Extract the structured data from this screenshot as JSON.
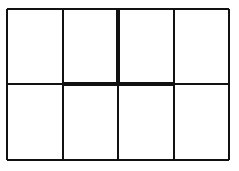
{
  "figure": {
    "title": "",
    "background_color": "#ffffff",
    "line_color": "#111111",
    "width": 239,
    "height": 171
  },
  "chart_data": {
    "type": "table",
    "title": "",
    "subtitle": "",
    "xlabel": "",
    "ylabel": "",
    "columns": 4,
    "rows": 2,
    "grid": true,
    "legend": "none",
    "bounds": {
      "left": 7,
      "right": 229,
      "top": 9,
      "bottom": 160
    },
    "column_dividers_x": [
      63,
      118,
      174
    ],
    "row_dividers_y": [
      84
    ],
    "column_edges_x": [
      7,
      63,
      118,
      174,
      229
    ],
    "row_edges_y": [
      9,
      84,
      160
    ],
    "cells": [
      [
        {
          "row": 0,
          "col": 0,
          "text": "",
          "fill": "#ffffff"
        },
        {
          "row": 0,
          "col": 1,
          "text": "",
          "fill": "#ffffff"
        },
        {
          "row": 0,
          "col": 2,
          "text": "",
          "fill": "#ffffff"
        },
        {
          "row": 0,
          "col": 3,
          "text": "",
          "fill": "#ffffff"
        }
      ],
      [
        {
          "row": 1,
          "col": 0,
          "text": "",
          "fill": "#ffffff"
        },
        {
          "row": 1,
          "col": 1,
          "text": "",
          "fill": "#ffffff"
        },
        {
          "row": 1,
          "col": 2,
          "text": "",
          "fill": "#ffffff"
        },
        {
          "row": 1,
          "col": 3,
          "text": "",
          "fill": "#ffffff"
        }
      ]
    ],
    "line_widths": {
      "thin": 1.2,
      "thick": 3.2
    },
    "segments": [
      {
        "name": "outer-border-top",
        "orientation": "horizontal",
        "x1": 7,
        "y1": 9,
        "x2": 229,
        "y2": 9,
        "weight": "thin"
      },
      {
        "name": "outer-border-bottom",
        "orientation": "horizontal",
        "x1": 7,
        "y1": 160,
        "x2": 229,
        "y2": 160,
        "weight": "thin"
      },
      {
        "name": "outer-border-left",
        "orientation": "vertical",
        "x1": 7,
        "y1": 9,
        "x2": 7,
        "y2": 160,
        "weight": "thin"
      },
      {
        "name": "outer-border-right",
        "orientation": "vertical",
        "x1": 229,
        "y1": 9,
        "x2": 229,
        "y2": 160,
        "weight": "thin"
      },
      {
        "name": "divider-vertical-1",
        "orientation": "vertical",
        "x1": 63,
        "y1": 9,
        "x2": 63,
        "y2": 160,
        "weight": "thin"
      },
      {
        "name": "divider-vertical-2-top",
        "orientation": "vertical",
        "x1": 118,
        "y1": 9,
        "x2": 118,
        "y2": 84,
        "weight": "thick"
      },
      {
        "name": "divider-vertical-2-bottom",
        "orientation": "vertical",
        "x1": 118,
        "y1": 84,
        "x2": 118,
        "y2": 160,
        "weight": "thin"
      },
      {
        "name": "divider-vertical-3",
        "orientation": "vertical",
        "x1": 174,
        "y1": 9,
        "x2": 174,
        "y2": 160,
        "weight": "thin"
      },
      {
        "name": "divider-horizontal-left",
        "orientation": "horizontal",
        "x1": 7,
        "y1": 84,
        "x2": 63,
        "y2": 84,
        "weight": "thin"
      },
      {
        "name": "divider-horizontal-center",
        "orientation": "horizontal",
        "x1": 63,
        "y1": 84,
        "x2": 174,
        "y2": 84,
        "weight": "thick"
      },
      {
        "name": "divider-horizontal-right",
        "orientation": "horizontal",
        "x1": 174,
        "y1": 84,
        "x2": 229,
        "y2": 84,
        "weight": "thin"
      }
    ],
    "annotations": []
  }
}
